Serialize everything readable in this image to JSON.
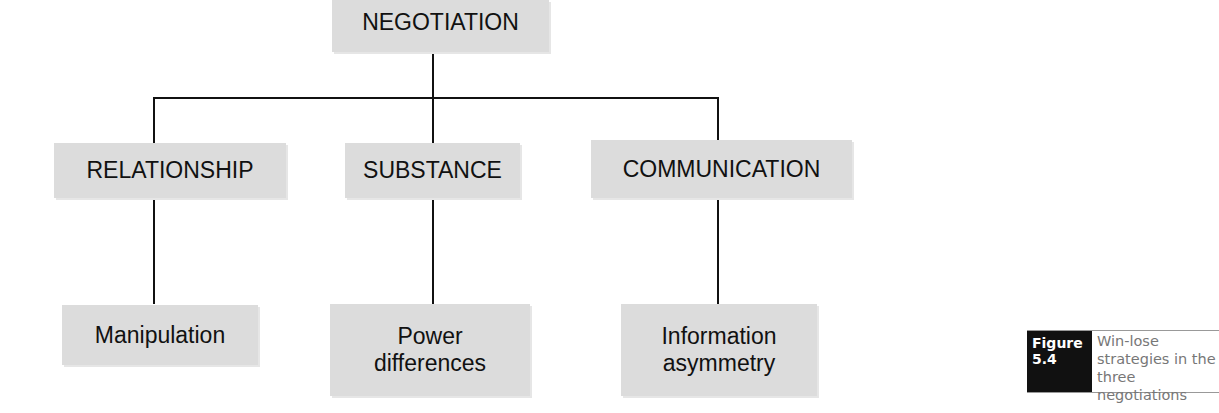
{
  "diagram": {
    "root": {
      "label": "NEGOTIATION"
    },
    "branches": [
      {
        "label": "RELATIONSHIP",
        "strategy": "Manipulation"
      },
      {
        "label": "SUBSTANCE",
        "strategy": "Power differences"
      },
      {
        "label": "COMMUNICATION",
        "strategy": "Information asymmetry"
      }
    ]
  },
  "caption": {
    "figure_label": "Figure 5.4",
    "text": "Win-lose strategies in the three negotiations"
  },
  "colors": {
    "box_fill": "#dcdcdc",
    "line": "#111111",
    "caption_label_bg": "#111111",
    "caption_text": "#777777"
  }
}
